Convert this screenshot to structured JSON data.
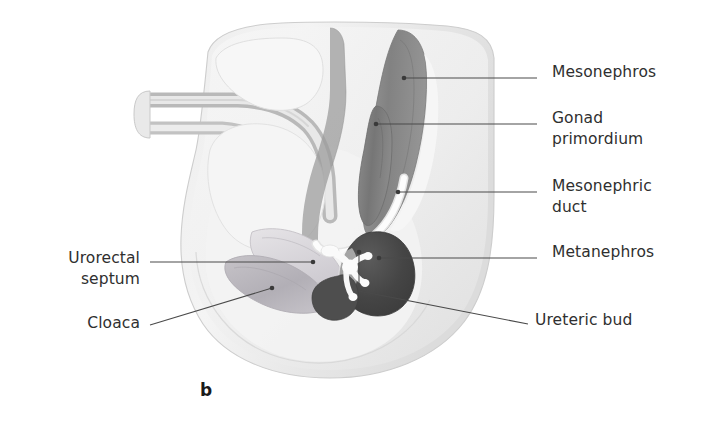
{
  "figure": {
    "panel_letter": "b",
    "background_color": "#ffffff",
    "text_color": "#2f2f2f",
    "leader_line_color": "#4a4a4a"
  },
  "labels": {
    "right": [
      {
        "id": "mesonephros",
        "text": "Mesonephros",
        "text_x": 552,
        "text_y": 62,
        "leader": {
          "x1": 537,
          "y1": 78,
          "x2": 404,
          "y2": 78,
          "dot_x": 404,
          "dot_y": 78
        }
      },
      {
        "id": "gonad-primordium",
        "line1": "Gonad",
        "line2": "primordium",
        "text": "Gonad\nprimordium",
        "text_x": 552,
        "text_y": 108,
        "leader": {
          "x1": 537,
          "y1": 124,
          "x2": 376,
          "y2": 124,
          "dot_x": 376,
          "dot_y": 124
        }
      },
      {
        "id": "mesonephric-duct",
        "line1": "Mesonephric",
        "line2": "duct",
        "text": "Mesonephric\nduct",
        "text_x": 552,
        "text_y": 176,
        "leader": {
          "x1": 537,
          "y1": 192,
          "x2": 398,
          "y2": 192,
          "dot_x": 398,
          "dot_y": 192
        }
      },
      {
        "id": "metanephros",
        "text": "Metanephros",
        "text_x": 552,
        "text_y": 242,
        "leader": {
          "x1": 537,
          "y1": 258,
          "x2": 379,
          "y2": 258,
          "dot_x": 379,
          "dot_y": 258
        }
      },
      {
        "id": "ureteric-bud",
        "text": "Ureteric bud",
        "text_x": 535,
        "text_y": 310,
        "leader": {
          "x1": 528,
          "y1": 324,
          "x2": 363,
          "y2": 291,
          "dot_x": 359,
          "dot_y": 252
        }
      }
    ],
    "left": [
      {
        "id": "urorectal-septum",
        "line1": "Urorectal",
        "line2": "septum",
        "text": "Urorectal\nseptum",
        "text_right": 140,
        "text_y": 248,
        "leader": {
          "x1": 150,
          "y1": 262,
          "x2": 313,
          "y2": 262,
          "dot_x": 313,
          "dot_y": 262
        }
      },
      {
        "id": "cloaca",
        "text": "Cloaca",
        "text_right": 140,
        "text_y": 313,
        "leader": {
          "x1": 150,
          "y1": 325,
          "x2": 272,
          "y2": 288,
          "dot_x": 272,
          "dot_y": 288
        }
      }
    ]
  },
  "anatomy": {
    "body_outline": {
      "name": "embryo-body-silhouette",
      "fill_light": "#f2f2f2",
      "fill_mid": "#e4e4e4",
      "stroke": "#cfcfcf"
    },
    "structures": [
      {
        "id": "mesonephros",
        "label": "Mesonephros",
        "fill": "#8d8d8d"
      },
      {
        "id": "gonad-primordium",
        "label": "Gonad primordium",
        "fill": "#7b7b7b"
      },
      {
        "id": "mesonephric-duct",
        "label": "Mesonephric duct",
        "fill": "#fbfbfb"
      },
      {
        "id": "metanephros",
        "label": "Metanephros",
        "fill": "#4a4a4a"
      },
      {
        "id": "ureteric-bud",
        "label": "Ureteric bud",
        "fill": "#fafafa"
      },
      {
        "id": "cloaca",
        "label": "Cloaca",
        "fill": "#b9b6bb"
      },
      {
        "id": "urorectal-septum",
        "label": "Urorectal septum",
        "fill": "#d8d6da"
      },
      {
        "id": "hindgut-tube",
        "label": "Hindgut",
        "fill": "#c9c9c9"
      },
      {
        "id": "allantois-tube",
        "label": "Allantois / umbilical stalk",
        "fill": "#d2d2d2"
      }
    ]
  }
}
